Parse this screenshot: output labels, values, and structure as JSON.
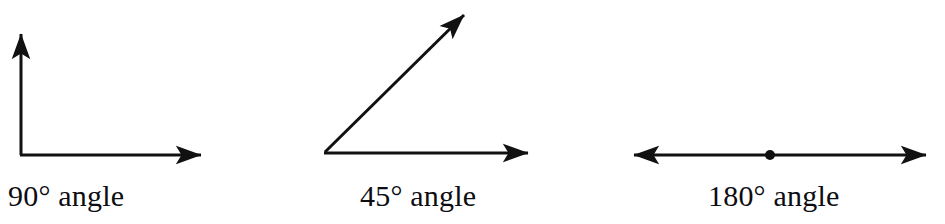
{
  "diagram": {
    "background_color": "#ffffff",
    "stroke_color": "#111111",
    "text_color": "#0d0d12",
    "stroke_width": 3,
    "figures": [
      {
        "id": "right-angle",
        "caption": "90° angle",
        "angle_degrees": 90,
        "vertex": [
          21,
          155
        ],
        "rays": [
          {
            "name": "vertical-ray",
            "from": [
              21,
              155
            ],
            "to": [
              21,
              26
            ],
            "arrowhead": "end",
            "direction_degrees": 90
          },
          {
            "name": "horizontal-ray",
            "from": [
              21,
              155
            ],
            "to": [
              210,
              155
            ],
            "arrowhead": "end",
            "direction_degrees": 0
          }
        ],
        "vertex_dot": false
      },
      {
        "id": "acute-angle",
        "caption": "45° angle",
        "angle_degrees": 45,
        "vertex": [
          25,
          152
        ],
        "rays": [
          {
            "name": "diagonal-ray",
            "from": [
              25,
              152
            ],
            "to": [
              172,
              7
            ],
            "arrowhead": "end",
            "direction_degrees": 45
          },
          {
            "name": "horizontal-ray",
            "from": [
              25,
              152
            ],
            "to": [
              237,
              153
            ],
            "arrowhead": "end",
            "direction_degrees": 0
          }
        ],
        "vertex_dot": false
      },
      {
        "id": "straight-angle",
        "caption": "180° angle",
        "angle_degrees": 180,
        "vertex": [
          150,
          155
        ],
        "rays": [
          {
            "name": "left-ray",
            "from": [
              150,
              155
            ],
            "to": [
              5,
              155
            ],
            "arrowhead": "end",
            "direction_degrees": 180
          },
          {
            "name": "right-ray",
            "from": [
              150,
              155
            ],
            "to": [
              315,
              155
            ],
            "arrowhead": "end",
            "direction_degrees": 0
          }
        ],
        "vertex_dot": true,
        "vertex_dot_radius": 5
      }
    ]
  }
}
